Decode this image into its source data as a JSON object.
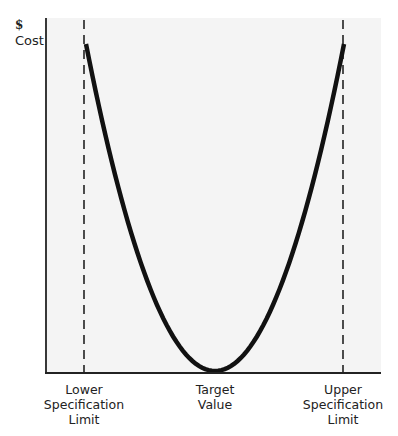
{
  "chart_data": {
    "type": "line",
    "title": "",
    "ylabel": "$ Cost",
    "ylabel_parts": {
      "symbol": "$",
      "text": "Cost"
    },
    "xlabel": "",
    "x_tick_labels": [
      {
        "position": "lower",
        "text": "Lower\nSpecification\nLimit"
      },
      {
        "position": "target",
        "text": "Target\nValue"
      },
      {
        "position": "upper",
        "text": "Upper\nSpecification\nLimit"
      }
    ],
    "series": [
      {
        "name": "Cost (quadratic loss)",
        "shape": "parabola",
        "x": [
          -1.0,
          -0.75,
          -0.5,
          -0.25,
          0.0,
          0.25,
          0.5,
          0.75,
          1.0
        ],
        "values": [
          1.0,
          0.5625,
          0.25,
          0.0625,
          0.0,
          0.0625,
          0.25,
          0.5625,
          1.0
        ]
      }
    ],
    "reference_lines": [
      {
        "name": "Lower Specification Limit",
        "x": -1.0,
        "style": "dashed"
      },
      {
        "name": "Upper Specification Limit",
        "x": 1.0,
        "style": "dashed"
      }
    ],
    "xlim": [
      -1.33,
      1.3
    ],
    "ylim": [
      0,
      1.0
    ],
    "grid": false,
    "legend": null
  },
  "colors": {
    "plot_background": "#f4f4f4",
    "curve": "#111111",
    "axis": "#222222",
    "dashed_line": "#222222"
  }
}
